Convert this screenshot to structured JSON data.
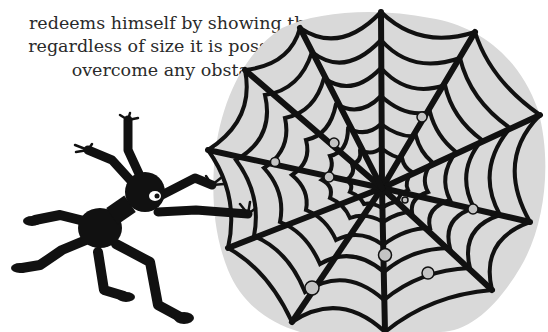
{
  "page": {
    "paragraph": {
      "lines": [
        "ig                                        y",
        "redeems himself by showing that",
        "regardless of size it is possible to",
        "overcome any obstacle."
      ]
    },
    "illustration": {
      "subject": "cartoon spider climbing toward a spider web",
      "colors": {
        "ink": "#111111",
        "web_background": "#d9d9d9",
        "web_dewdrop": "#c4c4c4",
        "eye_white": "#ffffff",
        "page_background": "#ffffff"
      }
    }
  }
}
